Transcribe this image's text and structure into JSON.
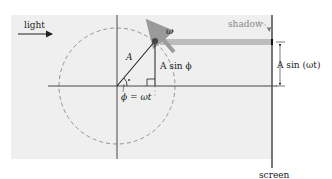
{
  "labels": {
    "light": "light",
    "omega": "ω",
    "amplitude": "A",
    "vertical_component": "A sin ϕ",
    "angle": "ϕ = ωt",
    "shadow": "shadow",
    "shadow_height": "A sin (ωt)",
    "screen": "screen"
  },
  "colors": {
    "panel": "#efefef",
    "axis": "#333333",
    "circle": "#8a8a8a",
    "shadow_bar": "#bdbdbd",
    "point": "#444444",
    "screen": "#555555",
    "rotation_arrow": "#9a9a9a"
  },
  "geometry": {
    "circle_center": [
      117,
      86
    ],
    "radius": 58,
    "point": [
      155,
      41
    ],
    "screen_x": 272
  }
}
